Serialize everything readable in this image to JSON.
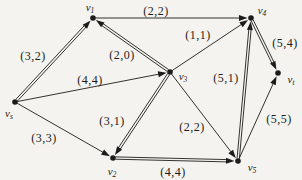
{
  "diagram": {
    "type": "directed-flow-network",
    "ink_color": "#1d1c1a",
    "paper_color": "#f4f3ef",
    "nodes": [
      {
        "id": "v1",
        "base": "v",
        "sub": "1",
        "x": 93,
        "y": 18,
        "lx": 90,
        "ly": 7
      },
      {
        "id": "v4",
        "base": "v",
        "sub": "4",
        "x": 251,
        "y": 18,
        "lx": 262,
        "ly": 10
      },
      {
        "id": "v3",
        "base": "v",
        "sub": "3",
        "x": 170,
        "y": 72,
        "lx": 183,
        "ly": 76
      },
      {
        "id": "vt",
        "base": "v",
        "sub": "t",
        "x": 278,
        "y": 73,
        "lx": 291,
        "ly": 79
      },
      {
        "id": "vs",
        "base": "v",
        "sub": "s",
        "x": 15,
        "y": 102,
        "lx": 9,
        "ly": 113
      },
      {
        "id": "v2",
        "base": "v",
        "sub": "2",
        "x": 113,
        "y": 158,
        "lx": 112,
        "ly": 171
      },
      {
        "id": "v5",
        "base": "v",
        "sub": "5",
        "x": 238,
        "y": 161,
        "lx": 252,
        "ly": 167
      }
    ],
    "edges": [
      {
        "from": "vs",
        "to": "v1",
        "label": "(3,2)",
        "style": "double",
        "lx": 33,
        "ly": 56
      },
      {
        "from": "v1",
        "to": "v4",
        "label": "(2,2)",
        "style": "single",
        "lx": 156,
        "ly": 11
      },
      {
        "from": "v3",
        "to": "v1",
        "label": "(2,0)",
        "style": "double",
        "lx": 122,
        "ly": 55
      },
      {
        "from": "v3",
        "to": "v4",
        "label": "(1,1)",
        "style": "single",
        "lx": 198,
        "ly": 35
      },
      {
        "from": "v4",
        "to": "vt",
        "label": "(5,4)",
        "style": "double",
        "lx": 285,
        "ly": 43
      },
      {
        "from": "vs",
        "to": "v3",
        "label": "(4,4)",
        "style": "single",
        "lx": 90,
        "ly": 80
      },
      {
        "from": "v5",
        "to": "v4",
        "label": "(5,1)",
        "style": "double",
        "lx": 226,
        "ly": 78
      },
      {
        "from": "v3",
        "to": "v2",
        "label": "(3,1)",
        "style": "double",
        "lx": 112,
        "ly": 121
      },
      {
        "from": "v3",
        "to": "v5",
        "label": "(2,2)",
        "style": "single",
        "lx": 192,
        "ly": 127
      },
      {
        "from": "vs",
        "to": "v2",
        "label": "(3,3)",
        "style": "single",
        "lx": 44,
        "ly": 138
      },
      {
        "from": "v2",
        "to": "v5",
        "label": "(4,4)",
        "style": "double",
        "lx": 173,
        "ly": 172
      },
      {
        "from": "v5",
        "to": "vt",
        "label": "(5,5)",
        "style": "single",
        "lx": 279,
        "ly": 119
      }
    ]
  }
}
